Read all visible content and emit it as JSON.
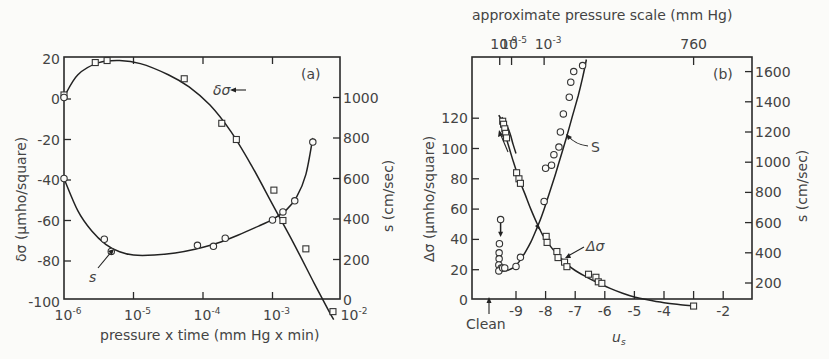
{
  "chart_data": [
    {
      "id": "a",
      "type": "scatter",
      "panel_label": "(a)",
      "title": "",
      "xlabel": "pressure x time (mm Hg x min)",
      "xscale": "log",
      "xlim": [
        1e-06,
        0.01
      ],
      "x_ticks": [
        "10^-6",
        "10^-5",
        "10^-4",
        "10^-3",
        "10^-2"
      ],
      "ylabel_left": "δσ (μmho/square)",
      "ylim_left": [
        -100,
        20
      ],
      "y_ticks_left": [
        20,
        0,
        -20,
        -40,
        -60,
        -80,
        -100
      ],
      "ylabel_right": "s (cm/sec)",
      "ylim_right": [
        0,
        1200
      ],
      "y_ticks_right": [
        1000,
        800,
        600,
        400,
        200,
        0
      ],
      "grid": false,
      "series": [
        {
          "name": "δσ",
          "axis": "left",
          "marker": "square",
          "points_log10x": [
            [
              -6.0,
              2
            ],
            [
              -5.55,
              18
            ],
            [
              -5.38,
              19
            ],
            [
              -4.27,
              10
            ],
            [
              -3.73,
              -12
            ],
            [
              -3.52,
              -20
            ],
            [
              -2.98,
              -45
            ],
            [
              -2.85,
              -60
            ],
            [
              -2.52,
              -74
            ],
            [
              -2.13,
              -105
            ]
          ],
          "curve_log10x": [
            [
              -6.0,
              1
            ],
            [
              -5.8,
              12
            ],
            [
              -5.5,
              18
            ],
            [
              -5.2,
              19
            ],
            [
              -4.9,
              17.5
            ],
            [
              -4.5,
              12
            ],
            [
              -4.2,
              6
            ],
            [
              -3.9,
              -3
            ],
            [
              -3.6,
              -16
            ],
            [
              -3.3,
              -33
            ],
            [
              -3.0,
              -52
            ],
            [
              -2.7,
              -71
            ],
            [
              -2.4,
              -91
            ],
            [
              -2.2,
              -104
            ],
            [
              -2.12,
              -109
            ]
          ]
        },
        {
          "name": "s",
          "axis": "right",
          "marker": "circle",
          "points_log10x": [
            [
              -6.0,
              1000
            ],
            [
              -6.0,
              600
            ],
            [
              -5.42,
              300
            ],
            [
              -5.32,
              240
            ],
            [
              -4.08,
              270
            ],
            [
              -3.85,
              265
            ],
            [
              -3.68,
              305
            ],
            [
              -3.0,
              395
            ],
            [
              -2.85,
              435
            ],
            [
              -2.68,
              490
            ],
            [
              -2.42,
              780
            ]
          ],
          "curve_log10x": [
            [
              -6.0,
              600
            ],
            [
              -5.8,
              440
            ],
            [
              -5.6,
              340
            ],
            [
              -5.4,
              275
            ],
            [
              -5.2,
              238
            ],
            [
              -5.0,
              222
            ],
            [
              -4.7,
              222
            ],
            [
              -4.4,
              232
            ],
            [
              -4.1,
              252
            ],
            [
              -3.8,
              280
            ],
            [
              -3.5,
              320
            ],
            [
              -3.2,
              365
            ],
            [
              -3.0,
              398
            ],
            [
              -2.8,
              445
            ],
            [
              -2.65,
              510
            ],
            [
              -2.52,
              620
            ],
            [
              -2.42,
              800
            ]
          ]
        }
      ],
      "annotations": [
        {
          "text": "δσ",
          "target": "δσ curve",
          "arrow": true
        },
        {
          "text": "s",
          "target": "s curve",
          "arrow": true
        }
      ]
    },
    {
      "id": "b",
      "type": "scatter",
      "panel_label": "(b)",
      "title": "approximate pressure scale (mm Hg)",
      "top_axis_ticks": [
        {
          "label": "10^-9",
          "u": -9.55
        },
        {
          "label": "10^-5",
          "u": -9.15
        },
        {
          "label": "10^-3",
          "u": -8.05
        },
        {
          "label": "760",
          "u": -3.0
        }
      ],
      "xlabel": "u_s",
      "xlim": [
        -10.1,
        -1.0
      ],
      "x_ticks": [
        -9,
        -8,
        -7,
        -6,
        -5,
        -4,
        -3,
        -2
      ],
      "x_tick_labels": [
        "-9",
        "-8",
        "-7",
        "-6",
        "-5",
        "-4",
        "",
        "-2"
      ],
      "extra_x_label": {
        "text": "Clean",
        "u": -9.55
      },
      "ylabel_left": "Δσ (μmho/square)",
      "ylim_left": [
        0,
        160
      ],
      "y_ticks_left": [
        0,
        20,
        40,
        60,
        80,
        100,
        120
      ],
      "ylabel_right": "s (cm/sec)",
      "ylim_right": [
        100,
        1700
      ],
      "y_ticks_right": [
        200,
        400,
        600,
        800,
        1000,
        1200,
        1400,
        1600
      ],
      "grid": false,
      "series": [
        {
          "name": "Δσ",
          "axis": "left",
          "marker": "square",
          "points": [
            [
              -9.45,
              118
            ],
            [
              -9.42,
              116
            ],
            [
              -9.38,
              113
            ],
            [
              -9.35,
              110
            ],
            [
              -9.32,
              107
            ],
            [
              -8.98,
              84
            ],
            [
              -8.9,
              80
            ],
            [
              -8.85,
              77
            ],
            [
              -7.98,
              42
            ],
            [
              -7.95,
              38
            ],
            [
              -7.62,
              32
            ],
            [
              -7.58,
              28
            ],
            [
              -7.36,
              25
            ],
            [
              -7.28,
              22
            ],
            [
              -6.55,
              17
            ],
            [
              -6.3,
              15
            ],
            [
              -6.22,
              12
            ],
            [
              -6.1,
              11
            ],
            [
              -3.0,
              -4
            ]
          ],
          "curve": [
            [
              -9.58,
              122
            ],
            [
              -9.5,
              119
            ],
            [
              -9.4,
              113
            ],
            [
              -9.3,
              105
            ],
            [
              -9.1,
              92
            ],
            [
              -8.9,
              80
            ],
            [
              -8.7,
              70
            ],
            [
              -8.5,
              60
            ],
            [
              -8.3,
              51
            ],
            [
              -8.1,
              43
            ],
            [
              -7.9,
              37
            ],
            [
              -7.6,
              30
            ],
            [
              -7.3,
              24
            ],
            [
              -7.0,
              19.5
            ],
            [
              -6.6,
              15
            ],
            [
              -6.2,
              11
            ],
            [
              -5.8,
              7.5
            ],
            [
              -5.4,
              4.5
            ],
            [
              -5.0,
              2
            ],
            [
              -4.6,
              0.3
            ],
            [
              -4.0,
              -1.8
            ],
            [
              -3.5,
              -3
            ],
            [
              -3.0,
              -4
            ]
          ],
          "return_curve": [
            [
              -9.58,
              122
            ],
            [
              -9.45,
              118
            ],
            [
              -9.3,
              111
            ],
            [
              -9.2,
              104
            ],
            [
              -9.1,
              98
            ]
          ]
        },
        {
          "name": "s",
          "axis": "right",
          "marker": "circle",
          "points": [
            [
              -9.52,
              620
            ],
            [
              -9.56,
              460
            ],
            [
              -9.57,
              400
            ],
            [
              -9.57,
              360
            ],
            [
              -9.58,
              320
            ],
            [
              -9.5,
              300
            ],
            [
              -9.58,
              280
            ],
            [
              -9.45,
              300
            ],
            [
              -9.38,
              300
            ],
            [
              -9.0,
              310
            ],
            [
              -8.85,
              370
            ],
            [
              -8.05,
              740
            ],
            [
              -8.0,
              960
            ],
            [
              -7.8,
              980
            ],
            [
              -7.72,
              1050
            ],
            [
              -7.55,
              1100
            ],
            [
              -7.5,
              1200
            ],
            [
              -7.4,
              1320
            ],
            [
              -7.2,
              1430
            ],
            [
              -7.15,
              1530
            ],
            [
              -7.05,
              1600
            ],
            [
              -6.75,
              1640
            ]
          ],
          "curve": [
            [
              -9.55,
              290
            ],
            [
              -9.45,
              282
            ],
            [
              -9.3,
              283
            ],
            [
              -9.1,
              300
            ],
            [
              -8.9,
              340
            ],
            [
              -8.7,
              400
            ],
            [
              -8.5,
              470
            ],
            [
              -8.3,
              560
            ],
            [
              -8.1,
              660
            ],
            [
              -7.9,
              780
            ],
            [
              -7.7,
              900
            ],
            [
              -7.5,
              1030
            ],
            [
              -7.3,
              1160
            ],
            [
              -7.1,
              1300
            ],
            [
              -6.9,
              1440
            ],
            [
              -6.75,
              1560
            ],
            [
              -6.62,
              1680
            ]
          ],
          "clean_drop": [
            [
              -9.52,
              620
            ],
            [
              -9.52,
              530
            ]
          ]
        }
      ],
      "annotations": [
        {
          "text": "S",
          "target": "s curve",
          "arrow": true
        },
        {
          "text": "Δσ",
          "target": "Δσ curve",
          "arrow": true
        },
        {
          "text": "Clean",
          "arrow": "up"
        }
      ]
    }
  ],
  "panels": {
    "a": {
      "panel_label": "(a)",
      "xlabel": "pressure x time (mm Hg x min)",
      "ylabel_left": "δσ (μmho/square)",
      "ylabel_right": "s (cm/sec)",
      "curve_label_1": "δσ",
      "curve_label_2": "s"
    },
    "b": {
      "panel_label": "(b)",
      "title": "approximate pressure scale (mm Hg)",
      "xlabel": "u",
      "xlabel_sub": "s",
      "ylabel_left": "Δσ (μmho/square)",
      "ylabel_right": "s (cm/sec)",
      "curve_label_1": "S",
      "curve_label_2": "Δσ",
      "clean_label": "Clean"
    }
  }
}
